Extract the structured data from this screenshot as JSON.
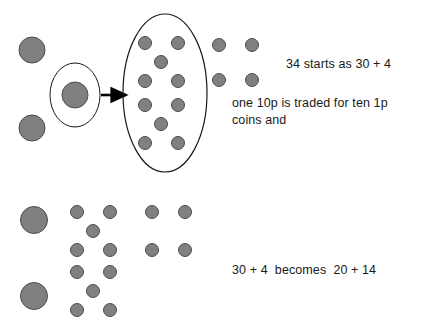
{
  "canvas": {
    "width": 443,
    "height": 333,
    "background": "#ffffff"
  },
  "style": {
    "coin_fill": "#808080",
    "coin_stroke": "#4d4d4d",
    "ring_stroke": "#1a1a1a",
    "arrow_color": "#000000",
    "text_color": "#1a1a1a"
  },
  "captions": {
    "top": "34 starts as 30 + 4",
    "middle": "one 10p is traded for ten 1p\ncoins and",
    "bottom": "30 + 4  becomes  20 + 14"
  },
  "diagram": {
    "top_row": {
      "tens_coins": [
        {
          "cx": 32,
          "cy": 50,
          "r": 13
        },
        {
          "cx": 32,
          "cy": 128,
          "r": 13
        },
        {
          "cx": 75,
          "cy": 95,
          "r": 13
        }
      ],
      "highlight_ellipse": {
        "cx": 75,
        "cy": 95,
        "rx": 25,
        "ry": 32
      },
      "arrow": {
        "x1": 101,
        "y1": 95,
        "x2": 126,
        "y2": 95
      },
      "traded_ellipse": {
        "cx": 165,
        "cy": 93,
        "rx": 42,
        "ry": 79
      },
      "traded_ones_coins": [
        {
          "cx": 145,
          "cy": 43,
          "r": 6.5
        },
        {
          "cx": 178,
          "cy": 43,
          "r": 6.5
        },
        {
          "cx": 161,
          "cy": 62,
          "r": 6.5
        },
        {
          "cx": 145,
          "cy": 81,
          "r": 6.5
        },
        {
          "cx": 178,
          "cy": 81,
          "r": 6.5
        },
        {
          "cx": 145,
          "cy": 105,
          "r": 6.5
        },
        {
          "cx": 178,
          "cy": 105,
          "r": 6.5
        },
        {
          "cx": 161,
          "cy": 124,
          "r": 6.5
        },
        {
          "cx": 145,
          "cy": 143,
          "r": 6.5
        },
        {
          "cx": 178,
          "cy": 143,
          "r": 6.5
        }
      ],
      "units_coins": [
        {
          "cx": 219,
          "cy": 45,
          "r": 6.5
        },
        {
          "cx": 252,
          "cy": 45,
          "r": 6.5
        },
        {
          "cx": 219,
          "cy": 80,
          "r": 6.5
        },
        {
          "cx": 252,
          "cy": 80,
          "r": 6.5
        }
      ]
    },
    "bottom_row": {
      "tens_coins": [
        {
          "cx": 34,
          "cy": 220,
          "r": 13.5
        },
        {
          "cx": 34,
          "cy": 296,
          "r": 13.5
        }
      ],
      "ones_group_upper": [
        {
          "cx": 77,
          "cy": 212,
          "r": 6.5
        },
        {
          "cx": 110,
          "cy": 212,
          "r": 6.5
        },
        {
          "cx": 93,
          "cy": 231,
          "r": 6.5
        },
        {
          "cx": 77,
          "cy": 250,
          "r": 6.5
        },
        {
          "cx": 110,
          "cy": 250,
          "r": 6.5
        }
      ],
      "ones_group_lower": [
        {
          "cx": 77,
          "cy": 272,
          "r": 6.5
        },
        {
          "cx": 110,
          "cy": 272,
          "r": 6.5
        },
        {
          "cx": 93,
          "cy": 291,
          "r": 6.5
        },
        {
          "cx": 77,
          "cy": 310,
          "r": 6.5
        },
        {
          "cx": 110,
          "cy": 310,
          "r": 6.5
        }
      ],
      "units_coins": [
        {
          "cx": 152,
          "cy": 212,
          "r": 6.5
        },
        {
          "cx": 185,
          "cy": 212,
          "r": 6.5
        },
        {
          "cx": 152,
          "cy": 250,
          "r": 6.5
        },
        {
          "cx": 185,
          "cy": 250,
          "r": 6.5
        }
      ]
    }
  }
}
